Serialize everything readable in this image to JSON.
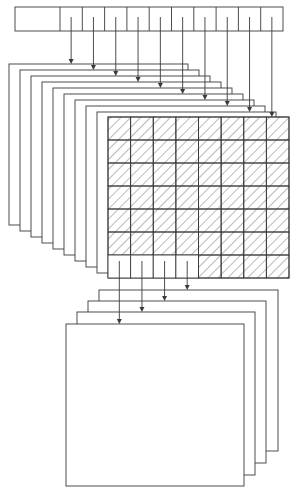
{
  "figure": {
    "type": "data-flow diagram",
    "stroke_color": "#3a3a3a",
    "background": "#ffffff",
    "top_register": {
      "x": 15,
      "y": 7,
      "height": 24,
      "first_cell_width": 45,
      "cell_width": 22.3,
      "cell_count": 10
    },
    "upper_stack": {
      "layer_count": 10,
      "left_start": 9,
      "left_step": 11,
      "top_start": 64,
      "top_step": 6,
      "right_start": 188,
      "right_step": 11,
      "bottom_start": 225,
      "bottom_step": 6
    },
    "hatched_grid": {
      "x": 108,
      "y": 117,
      "width": 181,
      "height": 161,
      "columns": 8,
      "rows": 7,
      "unhatched_cells_last_row": 4
    },
    "lower_stack": {
      "layer_count": 4,
      "lefts": [
        99,
        88,
        77,
        66
      ],
      "tops": [
        290,
        301,
        312,
        324
      ],
      "rights": [
        278,
        266,
        255,
        244
      ],
      "bottoms": [
        451,
        463,
        475,
        486
      ]
    }
  }
}
